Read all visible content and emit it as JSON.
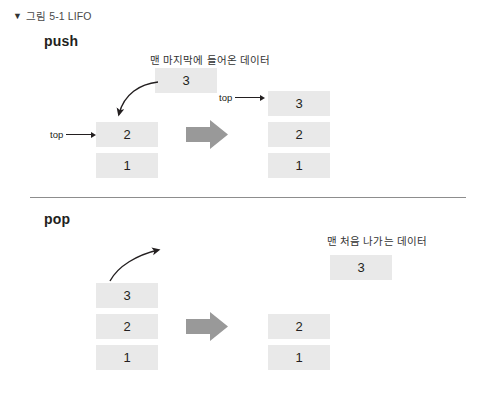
{
  "figure": {
    "caption": "그림 5-1 LIFO",
    "caption_chevron": "chevron-down-icon",
    "chevron_glyph": "▼"
  },
  "sections": {
    "push": {
      "title": "push",
      "annotation": "맨 마지막에 들어온 데이터",
      "incoming_box": "3",
      "left_stack": {
        "top_label": "top",
        "items": [
          "2",
          "1"
        ]
      },
      "right_stack": {
        "top_label": "top",
        "items": [
          "3",
          "2",
          "1"
        ]
      },
      "transition_arrow": "right-arrow-icon"
    },
    "pop": {
      "title": "pop",
      "annotation": "맨 처음 나가는 데이터",
      "outgoing_box": "3",
      "left_stack": {
        "items": [
          "3",
          "2",
          "1"
        ]
      },
      "right_stack": {
        "items": [
          "2",
          "1"
        ]
      },
      "transition_arrow": "right-arrow-icon"
    }
  },
  "colors": {
    "box_fill": "#e9e9e9",
    "block_arrow": "#999999",
    "divider": "#8d8d8d",
    "text": "#231f20"
  }
}
